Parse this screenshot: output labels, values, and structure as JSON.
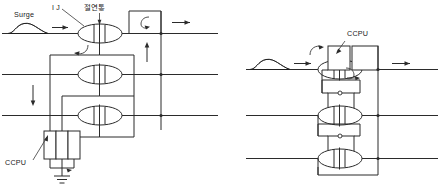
{
  "figure": {
    "type": "technical-circuit-diagram",
    "background_color": "#ffffff",
    "line_color": "#2b2b2b"
  },
  "left_diagram": {
    "name": "surge-injection-with-ccpu-network",
    "labels": {
      "surge": "Surge",
      "ij": "I J",
      "insulation": "절연통",
      "ccpu": "CCPU"
    },
    "bus_lines": 3,
    "coupler_count": 3,
    "resistor_count": 3,
    "ground": true,
    "arrows": [
      {
        "name": "surge-input-arrow",
        "direction": "right"
      },
      {
        "name": "output-arrow",
        "direction": "right"
      },
      {
        "name": "return-arrow-up",
        "direction": "up"
      },
      {
        "name": "return-arrow-down",
        "direction": "down"
      },
      {
        "name": "loop-arrow-top",
        "direction": "curved-left"
      }
    ]
  },
  "right_diagram": {
    "name": "surge-injection-ccpu-coupler-stack",
    "labels": {
      "ccpu": "CCPU"
    },
    "bus_lines": 3,
    "coupler_count": 3,
    "arrows": [
      {
        "name": "surge-input-arrow",
        "direction": "right"
      },
      {
        "name": "output-arrow",
        "direction": "right"
      },
      {
        "name": "loop-arrow-top",
        "direction": "curved-left"
      },
      {
        "name": "coupler-exit-arrow",
        "direction": "curved-right"
      }
    ]
  }
}
